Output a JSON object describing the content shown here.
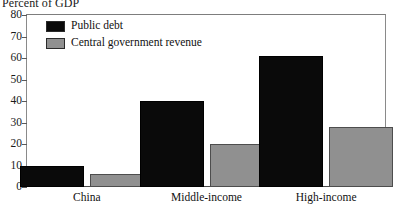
{
  "chart_data": {
    "type": "bar",
    "title": "Percent of GDP",
    "xlabel": "",
    "ylabel": "",
    "ylim": [
      0,
      80
    ],
    "yticks": [
      0,
      10,
      20,
      30,
      40,
      50,
      60,
      70,
      80
    ],
    "grid": false,
    "legend_position": "top-left",
    "categories": [
      "China",
      "Middle-income",
      "High-income"
    ],
    "series": [
      {
        "name": "Public debt",
        "color": "#0a0a0a",
        "values": [
          10,
          40,
          61
        ]
      },
      {
        "name": "Central government revenue",
        "color": "#909090",
        "values": [
          6,
          20,
          28
        ]
      }
    ]
  },
  "axis": {
    "tick_labels": [
      "0",
      "10",
      "20",
      "30",
      "40",
      "50",
      "60",
      "70",
      "80"
    ]
  },
  "legend": {
    "entries": [
      {
        "label": "Public debt",
        "swatch": "#0a0a0a"
      },
      {
        "label": "Central government revenue",
        "swatch": "#909090"
      }
    ]
  }
}
